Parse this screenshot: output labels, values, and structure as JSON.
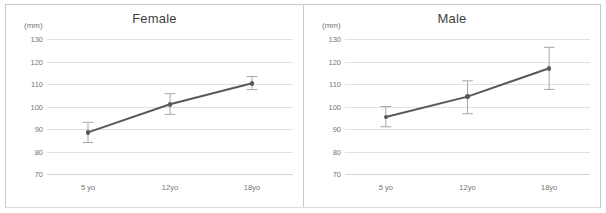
{
  "figure": {
    "panels": [
      {
        "title": "Female",
        "unit_label": "(mm)",
        "chart_data": {
          "type": "line",
          "title": "Female",
          "xlabel": "",
          "ylabel": "(mm)",
          "ylim": [
            70,
            130
          ],
          "yticks": [
            130,
            120,
            110,
            100,
            90,
            80,
            70
          ],
          "grid": true,
          "legend": "none",
          "categories": [
            "5 yo",
            "12yo",
            "18yo"
          ],
          "values": [
            88.5,
            101.0,
            110.3
          ],
          "error_upper": [
            93.0,
            105.7,
            113.3
          ],
          "error_lower": [
            84.0,
            96.5,
            107.5
          ],
          "series": [
            {
              "name": "Female",
              "values": [
                88.5,
                101.0,
                110.3
              ]
            }
          ]
        }
      },
      {
        "title": "Male",
        "unit_label": "(mm)",
        "chart_data": {
          "type": "line",
          "title": "Male",
          "xlabel": "",
          "ylabel": "(mm)",
          "ylim": [
            70,
            130
          ],
          "yticks": [
            130,
            120,
            110,
            100,
            90,
            80,
            70
          ],
          "grid": true,
          "legend": "none",
          "categories": [
            "5 yo",
            "12yo",
            "18yo"
          ],
          "values": [
            95.3,
            104.4,
            117.0
          ],
          "error_upper": [
            100.0,
            111.4,
            126.3
          ],
          "error_lower": [
            91.0,
            96.8,
            107.6
          ],
          "series": [
            {
              "name": "Male",
              "values": [
                95.3,
                104.4,
                117.0
              ]
            }
          ]
        }
      }
    ],
    "colors": {
      "line": "#595959",
      "marker": "#595959",
      "error_bar": "#a6a6a6",
      "grid": "#e2e2e2",
      "tick_text": "#767676",
      "title_text": "#3f3f3f",
      "frame": "#c9c9c9"
    }
  },
  "chart_data": [
    {
      "type": "line",
      "title": "Female",
      "xlabel": "",
      "ylabel": "(mm)",
      "ylim": [
        70,
        130
      ],
      "yticks": [
        130,
        120,
        110,
        100,
        90,
        80,
        70
      ],
      "grid": true,
      "legend": "none",
      "categories": [
        "5 yo",
        "12yo",
        "18yo"
      ],
      "values": [
        88.5,
        101.0,
        110.3
      ],
      "error_upper": [
        93.0,
        105.7,
        113.3
      ],
      "error_lower": [
        84.0,
        96.5,
        107.5
      ]
    },
    {
      "type": "line",
      "title": "Male",
      "xlabel": "",
      "ylabel": "(mm)",
      "ylim": [
        70,
        130
      ],
      "yticks": [
        130,
        120,
        110,
        100,
        90,
        80,
        70
      ],
      "grid": true,
      "legend": "none",
      "categories": [
        "5 yo",
        "12yo",
        "18yo"
      ],
      "values": [
        95.3,
        104.4,
        117.0
      ],
      "error_upper": [
        100.0,
        111.4,
        126.3
      ],
      "error_lower": [
        91.0,
        96.8,
        107.6
      ]
    }
  ]
}
